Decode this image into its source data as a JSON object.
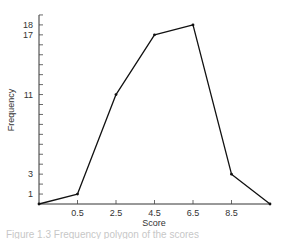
{
  "chart_data": {
    "type": "line",
    "title": "",
    "xlabel": "Score",
    "ylabel": "Frequency",
    "x_tick_labels": [
      "0.5",
      "2.5",
      "4.5",
      "6.5",
      "8.5"
    ],
    "y_tick_labels": [
      "1",
      "3",
      "11",
      "17",
      "18"
    ],
    "x": [
      -1.5,
      0.5,
      2.5,
      4.5,
      6.5,
      8.5,
      10.5
    ],
    "values": [
      0,
      1,
      11,
      17,
      18,
      3,
      0
    ],
    "series": [
      {
        "name": "Frequency polygon",
        "x": [
          -1.5,
          0.5,
          2.5,
          4.5,
          6.5,
          8.5,
          10.5
        ],
        "values": [
          0,
          1,
          11,
          17,
          18,
          3,
          0
        ]
      }
    ],
    "xlim": [
      -1.5,
      10.5
    ],
    "ylim": [
      0,
      19
    ],
    "y_minor_ticks_every": 1,
    "grid": false,
    "legend": "none"
  },
  "caption": "Figure 1.3  Frequency polygon of the scores"
}
